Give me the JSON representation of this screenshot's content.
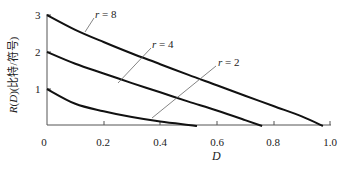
{
  "chart_data": {
    "type": "line",
    "title": "",
    "xlabel": "D",
    "ylabel": "R(D)(比特/符号)",
    "xlim": [
      0,
      1.0
    ],
    "ylim": [
      0,
      3
    ],
    "grid": false,
    "legend": "inline annotations with leader lines",
    "x_ticks": [
      "0",
      "0.2",
      "0.4",
      "0.6",
      "0.8",
      "1.0"
    ],
    "y_ticks": [
      "1",
      "2",
      "3"
    ],
    "series": [
      {
        "name": "r = 8",
        "x": [
          0,
          0.1,
          0.2,
          0.3,
          0.4,
          0.5,
          0.6,
          0.7,
          0.8,
          0.9,
          0.975
        ],
        "y": [
          3.0,
          2.6,
          2.27,
          1.96,
          1.67,
          1.38,
          1.1,
          0.82,
          0.54,
          0.26,
          0.0
        ]
      },
      {
        "name": "r = 4",
        "x": [
          0,
          0.1,
          0.2,
          0.3,
          0.4,
          0.5,
          0.6,
          0.7,
          0.76
        ],
        "y": [
          2.0,
          1.68,
          1.42,
          1.16,
          0.91,
          0.66,
          0.42,
          0.16,
          0.0
        ]
      },
      {
        "name": "r = 2",
        "x": [
          0,
          0.1,
          0.2,
          0.3,
          0.4,
          0.5,
          0.53
        ],
        "y": [
          1.0,
          0.6,
          0.4,
          0.24,
          0.12,
          0.03,
          0.0
        ]
      }
    ],
    "annotations": [
      {
        "text_var": "r",
        "text_val": "= 8",
        "series": "r = 8"
      },
      {
        "text_var": "r",
        "text_val": "= 4",
        "series": "r = 4"
      },
      {
        "text_var": "r",
        "text_val": "= 2",
        "series": "r = 2"
      }
    ]
  },
  "labels": {
    "ylabel_main": "R",
    "ylabel_paren": "(",
    "ylabel_var": "D",
    "ylabel_rest": ")(比特/符号)",
    "xlabel": "D",
    "xticks": [
      "0",
      "0.2",
      "0.4",
      "0.6",
      "0.8",
      "1.0"
    ],
    "yticks": [
      "1",
      "2",
      "3"
    ],
    "r8_var": "r",
    "r8_val": " = 8",
    "r4_var": "r",
    "r4_val": " = 4",
    "r2_var": "r",
    "r2_val": " = 2"
  },
  "colors": {
    "curve": "#111111",
    "axis": "#555555",
    "leader": "#666666"
  }
}
